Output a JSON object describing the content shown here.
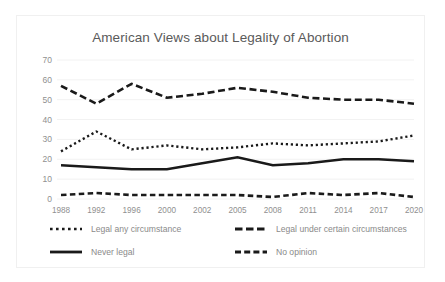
{
  "chart_data": {
    "type": "line",
    "title": "American Views about Legality of Abortion",
    "xlabel": "",
    "ylabel": "",
    "ylim": [
      0,
      70
    ],
    "ytick_step": 10,
    "grid": true,
    "legend_position": "bottom",
    "categories": [
      "1988",
      "1992",
      "1996",
      "2000",
      "2002",
      "2005",
      "2008",
      "2011",
      "2014",
      "2017",
      "2020"
    ],
    "yticks": [
      "0",
      "10",
      "20",
      "30",
      "40",
      "50",
      "60",
      "70"
    ],
    "series": [
      {
        "name": "Legal any circumstance",
        "style": "dotted",
        "color": "#1a1a1a",
        "values": [
          24,
          34,
          25,
          27,
          25,
          26,
          28,
          27,
          28,
          29,
          32
        ]
      },
      {
        "name": "Legal under certain circumstances",
        "style": "dashed",
        "color": "#1a1a1a",
        "values": [
          57,
          48,
          58,
          51,
          53,
          56,
          54,
          51,
          50,
          50,
          48
        ]
      },
      {
        "name": "Never legal",
        "style": "solid",
        "color": "#1a1a1a",
        "values": [
          17,
          16,
          15,
          15,
          18,
          21,
          17,
          18,
          20,
          20,
          19
        ]
      },
      {
        "name": "No opinion",
        "style": "dashed-short",
        "color": "#1a1a1a",
        "values": [
          2,
          3,
          2,
          2,
          2,
          2,
          1,
          3,
          2,
          3,
          1
        ]
      }
    ]
  },
  "legend": {
    "items": [
      {
        "label": "Legal any circumstance",
        "style": "dotted"
      },
      {
        "label": "Legal under certain circumstances",
        "style": "dashed"
      },
      {
        "label": "Never legal",
        "style": "solid"
      },
      {
        "label": "No opinion",
        "style": "dashed-short"
      }
    ]
  }
}
